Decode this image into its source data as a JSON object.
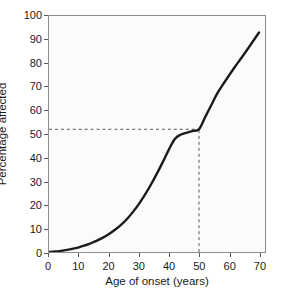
{
  "chart_data": {
    "type": "line",
    "title": "",
    "xlabel": "Age of onset (years)",
    "ylabel": "Percentage affected",
    "xlim": [
      0,
      72
    ],
    "ylim": [
      0,
      100
    ],
    "xticks": [
      0,
      10,
      20,
      30,
      40,
      50,
      60,
      70
    ],
    "yticks": [
      0,
      10,
      20,
      30,
      40,
      50,
      60,
      70,
      80,
      90,
      100
    ],
    "grid": false,
    "legend": "none",
    "series": [
      {
        "name": "Cumulative percentage affected",
        "x": [
          0,
          2,
          4,
          6,
          8,
          10,
          12,
          14,
          16,
          18,
          20,
          22,
          24,
          26,
          28,
          30,
          32,
          34,
          36,
          38,
          40,
          42,
          44,
          46,
          48,
          50,
          52,
          54,
          56,
          58,
          60,
          62,
          64,
          66,
          68,
          70
        ],
        "values": [
          0,
          0.2,
          0.5,
          0.9,
          1.4,
          2.0,
          2.8,
          3.7,
          4.8,
          6.1,
          7.6,
          9.4,
          11.5,
          14.0,
          17.0,
          20.4,
          24.3,
          28.6,
          33.3,
          38.3,
          43.5,
          48.0,
          49.8,
          50.6,
          51.3,
          52.0,
          57.0,
          62.0,
          67.0,
          71.0,
          74.8,
          78.5,
          82.0,
          85.6,
          89.3,
          93.0
        ]
      }
    ],
    "annotations": [
      {
        "name": "median-onset-reference",
        "type": "dashed-crosshair",
        "x": 50,
        "y": 52,
        "vertical_line": "from x-axis up to curve at age 50",
        "horizontal_line": "from y-axis right to curve at 52 percent"
      }
    ],
    "curve_color": "#1a1a1a",
    "dash_color": "#555555",
    "frame_color": "#8e8e8e",
    "plot_background": "#fbfbfb"
  }
}
